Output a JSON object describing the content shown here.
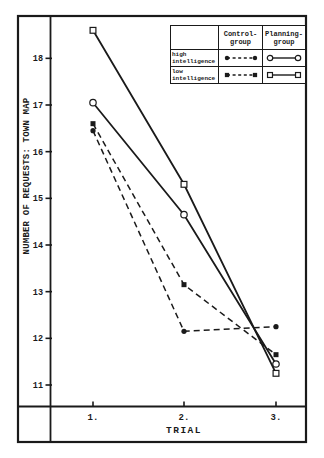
{
  "figure": {
    "background": "#ffffff",
    "ink": "#1a1a1a"
  },
  "chart_data": {
    "type": "line",
    "title": "",
    "xlabel": "TRIAL",
    "ylabel": "NUMBER OF REQUESTS: TOWN MAP",
    "x": [
      1,
      2,
      3
    ],
    "x_tick_labels": [
      "1.",
      "2.",
      "3."
    ],
    "y_ticks": [
      11,
      12,
      13,
      14,
      15,
      16,
      17,
      18
    ],
    "ylim": [
      10.75,
      18.9
    ],
    "grid": false,
    "legend_position": "top-right",
    "series": [
      {
        "name": "Control-group, high intelligence",
        "line": "dashed",
        "marker": "circle",
        "marker_fill": "filled",
        "values": [
          16.45,
          12.15,
          12.25
        ]
      },
      {
        "name": "Control-group, low intelligence",
        "line": "dashed",
        "marker": "square",
        "marker_fill": "filled",
        "values": [
          16.6,
          13.15,
          11.65
        ]
      },
      {
        "name": "Planning-group, high intelligence",
        "line": "solid",
        "marker": "circle",
        "marker_fill": "open",
        "values": [
          17.05,
          14.65,
          11.45
        ]
      },
      {
        "name": "Planning-group, low intelligence",
        "line": "solid",
        "marker": "square",
        "marker_fill": "open",
        "values": [
          18.6,
          15.3,
          11.25
        ]
      }
    ]
  },
  "legend": {
    "col_headers": [
      "Control-\ngroup",
      "Planning-\ngroup"
    ],
    "row_labels": [
      "high\nintelligence",
      "low\nintelligence"
    ]
  }
}
